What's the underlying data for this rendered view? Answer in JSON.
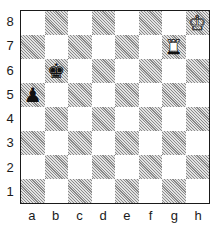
{
  "diagram": {
    "type": "chess-position",
    "files": [
      "a",
      "b",
      "c",
      "d",
      "e",
      "f",
      "g",
      "h"
    ],
    "ranks": [
      "8",
      "7",
      "6",
      "5",
      "4",
      "3",
      "2",
      "1"
    ],
    "pieces": [
      {
        "square": "h8",
        "color": "white",
        "piece": "king",
        "glyph": "♔"
      },
      {
        "square": "g7",
        "color": "white",
        "piece": "rook",
        "glyph": "♜"
      },
      {
        "square": "b6",
        "color": "black",
        "piece": "king",
        "glyph": "♚"
      },
      {
        "square": "a5",
        "color": "black",
        "piece": "pawn",
        "glyph": "♟"
      }
    ],
    "colors": {
      "light_square": "#ffffff",
      "dark_square_hatch": "#8a8a8a",
      "border": "#1a1a1a"
    }
  }
}
